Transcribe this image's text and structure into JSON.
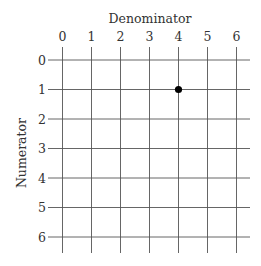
{
  "chart_data": {
    "type": "scatter",
    "title": "",
    "xlabel": "Denominator",
    "ylabel": "Numerator",
    "x_ticks": [
      "0",
      "1",
      "2",
      "3",
      "4",
      "5",
      "6"
    ],
    "y_ticks": [
      "0",
      "1",
      "2",
      "3",
      "4",
      "5",
      "6"
    ],
    "xlim": [
      0,
      6
    ],
    "ylim": [
      0,
      6
    ],
    "y_inverted": true,
    "grid": true,
    "x_axis_position": "top",
    "points": [
      {
        "x": 4,
        "y": 1
      }
    ],
    "colors": {
      "grid": "#555555",
      "point": "#000000",
      "text": "#333333"
    }
  }
}
